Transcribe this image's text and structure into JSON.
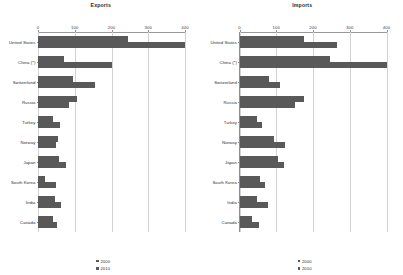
{
  "chart_data": [
    {
      "type": "bar",
      "title": "Exports",
      "xlabel": "",
      "ylabel": "",
      "xlim": [
        0,
        400
      ],
      "ticks": [
        0,
        100,
        200,
        300,
        400
      ],
      "grid": true,
      "legend_position": "bottom",
      "orientation": "horizontal",
      "categories": [
        "United States",
        "China (*)",
        "Switzerland",
        "Russia",
        "Turkey",
        "Norway",
        "Japan",
        "South Korea",
        "India",
        "Canada"
      ],
      "series": [
        {
          "name": "2000",
          "values": [
            245,
            70,
            95,
            105,
            42,
            55,
            58,
            20,
            45,
            40
          ]
        },
        {
          "name": "2010",
          "values": [
            400,
            200,
            155,
            85,
            60,
            48,
            75,
            50,
            62,
            52
          ]
        }
      ]
    },
    {
      "type": "bar",
      "title": "Imports",
      "xlabel": "",
      "ylabel": "",
      "xlim": [
        0,
        400
      ],
      "ticks": [
        0,
        100,
        200,
        300,
        400
      ],
      "grid": true,
      "legend_position": "bottom",
      "orientation": "horizontal",
      "categories": [
        "United States",
        "China (*)",
        "Switzerland",
        "Russia",
        "Turkey",
        "Norway",
        "Japan",
        "South Korea",
        "India",
        "Canada"
      ],
      "series": [
        {
          "name": "2000",
          "values": [
            175,
            245,
            80,
            175,
            48,
            95,
            105,
            55,
            48,
            35
          ]
        },
        {
          "name": "2010",
          "values": [
            265,
            400,
            110,
            150,
            62,
            125,
            120,
            70,
            78,
            52
          ]
        }
      ]
    }
  ],
  "legend": {
    "items": [
      {
        "label": "2000",
        "color": "#595959"
      },
      {
        "label": "2010",
        "color": "#595959"
      }
    ]
  },
  "colors": {
    "bar": "#595959",
    "grid": "#d2d2d2",
    "axis": "#8f8f8f",
    "text": "#2e2e2e",
    "background": "#ffffff"
  }
}
